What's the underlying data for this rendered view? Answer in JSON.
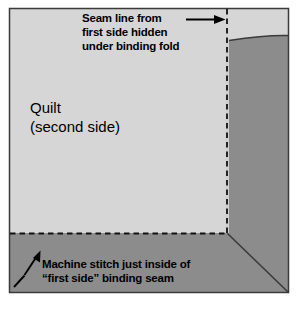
{
  "figure": {
    "title_label": "Quilt binding second-side diagram",
    "colors": {
      "background": "#ffffff",
      "quilt_face": "#d6d6d6",
      "binding_strip": "#8c8c8c",
      "binding_highlight": "#9a9a9a",
      "outline": "#3a3a3a",
      "stitch_line": "#1a1a1a",
      "text": "#000000"
    },
    "labels": {
      "quilt": {
        "line1": "Quilt",
        "line2": "(second side)"
      },
      "top_callout": {
        "line1": "Seam line from",
        "line2": "first side hidden",
        "line3": "under binding fold"
      },
      "bottom_callout": {
        "line1": "Machine stitch just inside of",
        "line2": "“first side” binding seam"
      }
    },
    "annotations": {
      "top_arrow_name": "arrow-to-seam-line",
      "bottom_arrow_name": "arrow-to-machine-stitch",
      "vertical_dashed_name": "vertical-seam-dashed-line",
      "horizontal_dashed_name": "horizontal-stitch-dashed-line",
      "miter_name": "mitered-corner-diagonal"
    }
  }
}
